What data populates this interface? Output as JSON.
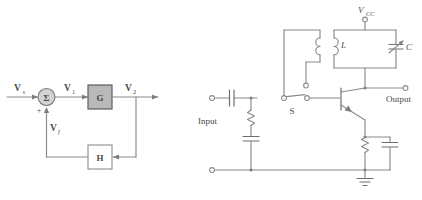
{
  "figure": {
    "background_color": "#ffffff",
    "line_color": "#8a8a8a",
    "block_fill_gray": "#b9b9b9",
    "block_fill_white": "#ffffff",
    "text_color": "#4a4a4a"
  },
  "block_diagram": {
    "name": "feedback-block-diagram",
    "signals": {
      "source": "V",
      "source_sub": "s",
      "error": "V",
      "error_sub": "1",
      "output": "V",
      "output_sub": "2",
      "feedback": "V",
      "feedback_sub": "f"
    },
    "summing_junction": {
      "symbol": "Σ",
      "plus_sign": "+"
    },
    "blocks": [
      {
        "label": "G",
        "fill": "#b9b9b9"
      },
      {
        "label": "H",
        "fill": "#ffffff"
      }
    ],
    "caption": ""
  },
  "circuit": {
    "name": "tuned-collector-oscillator",
    "labels": {
      "supply": "V",
      "supply_sub": "CC",
      "inductor": "L",
      "capacitor": "C",
      "switch": "S",
      "input": "Input",
      "output": "Output"
    },
    "components": [
      {
        "name": "input-coupling-capacitor",
        "type": "capacitor"
      },
      {
        "name": "base-bias-resistor",
        "type": "resistor"
      },
      {
        "name": "base-bypass-capacitor",
        "type": "capacitor"
      },
      {
        "name": "switch-s",
        "type": "switch",
        "label": "S"
      },
      {
        "name": "feedback-coil",
        "type": "inductor"
      },
      {
        "name": "tank-inductor",
        "type": "inductor",
        "label": "L"
      },
      {
        "name": "tank-variable-capacitor",
        "type": "variable-capacitor",
        "label": "C"
      },
      {
        "name": "npn-transistor",
        "type": "transistor-npn"
      },
      {
        "name": "emitter-resistor",
        "type": "resistor"
      },
      {
        "name": "emitter-bypass-capacitor",
        "type": "capacitor"
      },
      {
        "name": "ground",
        "type": "ground"
      }
    ],
    "terminals": [
      {
        "name": "vcc-terminal",
        "label": "V_CC"
      },
      {
        "name": "input-terminal",
        "label": "Input"
      },
      {
        "name": "output-terminal",
        "label": "Output"
      },
      {
        "name": "feedback-coil-terminal",
        "label": ""
      },
      {
        "name": "ground-rail-terminal",
        "label": ""
      }
    ]
  }
}
